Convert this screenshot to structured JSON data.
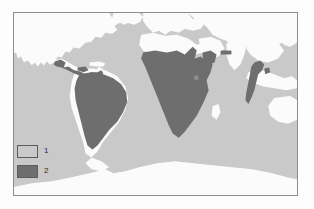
{
  "figure": {
    "kind": "world-distribution-map",
    "frame_border_color": "#8d8d8d"
  },
  "map": {
    "background_label": "ocean-and-non-range-background",
    "background_color": "#c9c9c9",
    "land_color": "#fbfbfb",
    "range_color": "#6e6e6e",
    "regions_shaded": [
      "Mexico and Central America",
      "Northern and central South America (Amazon basin)",
      "Sub-Saharan Africa",
      "Central Asia patch",
      "Indochina and Malay Peninsula"
    ]
  },
  "legend": {
    "items": [
      {
        "label": "1",
        "color": "#c9c9c9",
        "name": "legend-class-1"
      },
      {
        "label": "2",
        "color": "#6e6e6e",
        "name": "legend-class-2"
      }
    ]
  }
}
